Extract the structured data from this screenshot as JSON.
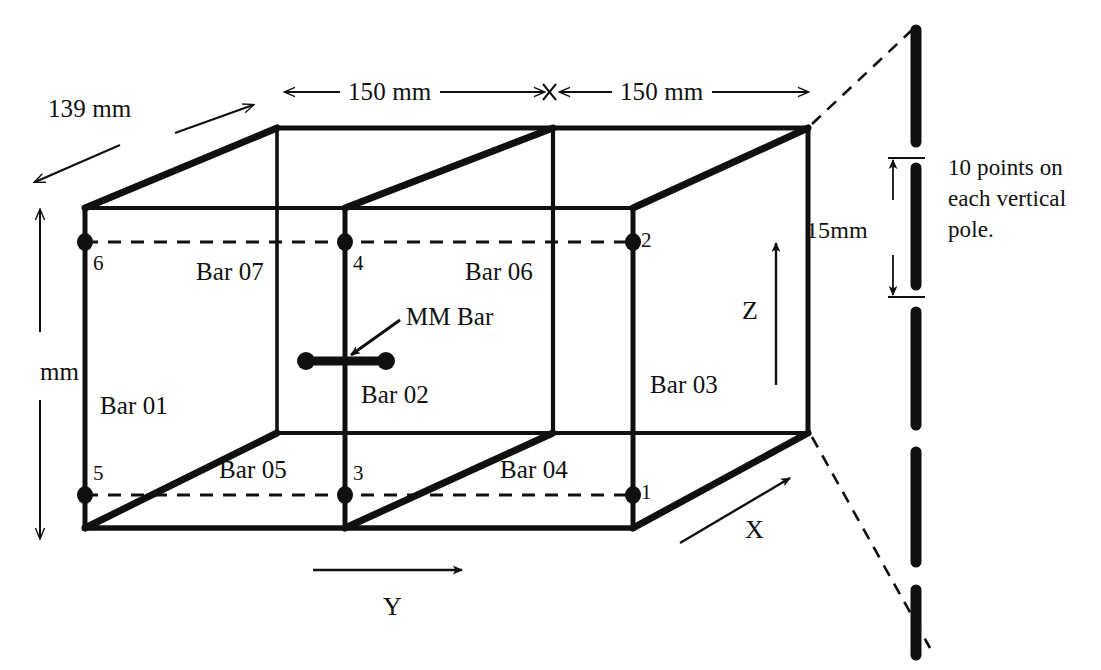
{
  "figure": {
    "type": "engineering-line-diagram"
  },
  "dimensions": {
    "depth_label": "139 mm",
    "width_left_label": "150 mm",
    "width_right_label": "150 mm",
    "height_label": "mm",
    "pole_spacing_label": "15mm"
  },
  "bars": {
    "bar01": "Bar 01",
    "bar02": "Bar 02",
    "bar03": "Bar 03",
    "bar04": "Bar 04",
    "bar05": "Bar 05",
    "bar06": "Bar 06",
    "bar07": "Bar 07",
    "mm_bar": "MM Bar"
  },
  "nodes": {
    "n1": "1",
    "n2": "2",
    "n3": "3",
    "n4": "4",
    "n5": "5",
    "n6": "6"
  },
  "axes": {
    "x": "X",
    "y": "Y",
    "z": "Z"
  },
  "annotation": {
    "pole_note_line1": "10 points on",
    "pole_note_line2": "each vertical",
    "pole_note_line3": "pole."
  },
  "colors": {
    "ink": "#101010",
    "background": "#ffffff"
  }
}
